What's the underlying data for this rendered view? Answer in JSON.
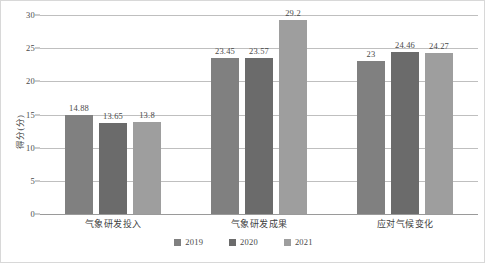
{
  "chart_data": {
    "type": "bar",
    "title": "",
    "subtitle": "",
    "xlabel": "",
    "ylabel": "得分(分)",
    "categories": [
      "气象研发投入",
      "气象研发成果",
      "应对气候变化"
    ],
    "series": [
      {
        "name": "2019",
        "values": [
          14.88,
          23.45,
          23
        ],
        "color": "#808080"
      },
      {
        "name": "2020",
        "values": [
          13.65,
          23.57,
          24.46
        ],
        "color": "#6b6b6b"
      },
      {
        "name": "2021",
        "values": [
          13.8,
          29.2,
          24.27
        ],
        "color": "#9e9e9e"
      }
    ],
    "value_labels": [
      [
        "14.88",
        "13.65",
        "13.8"
      ],
      [
        "23.45",
        "23.57",
        "29.2"
      ],
      [
        "23",
        "24.46",
        "24.27"
      ]
    ],
    "ylim": [
      0,
      30
    ],
    "yticks": [
      0,
      5,
      10,
      15,
      20,
      25,
      30
    ],
    "ytick_labels": [
      "0",
      "5",
      "10",
      "15",
      "20",
      "25",
      "30"
    ],
    "grid": true,
    "grid_axis": "y",
    "legend_position": "bottom",
    "bar_orientation": "vertical",
    "grouped": true
  },
  "colors": {
    "gridline": "#bfbfbf",
    "axis": "#9a9a9a",
    "text": "#4a4a4a",
    "background": "#ffffff",
    "border": "#d8d8d8"
  }
}
